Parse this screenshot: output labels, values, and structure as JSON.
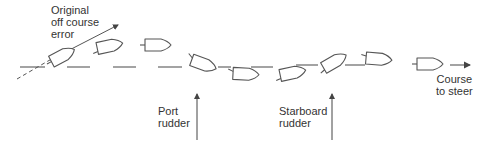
{
  "labels": {
    "original_error": [
      "Original",
      "off course",
      "error"
    ],
    "port_rudder": [
      "Port",
      "rudder"
    ],
    "starboard_rudder": [
      "Starboard",
      "rudder"
    ],
    "course_to_steer": [
      "Course",
      "to steer"
    ]
  },
  "colors": {
    "stroke": "#555555",
    "text": "#333333",
    "background": "#ffffff"
  }
}
